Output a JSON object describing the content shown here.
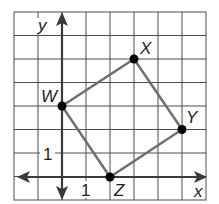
{
  "diagram": {
    "type": "coordinate-plane",
    "grid": {
      "columns": 8,
      "rows": 8,
      "x_range": [
        -2,
        6
      ],
      "y_range": [
        -1,
        7
      ],
      "line_color": "#4d4d4d"
    },
    "axes": {
      "x_label": "x",
      "y_label": "y",
      "x_tick_label": "1",
      "y_tick_label": "1",
      "color": "#3a3a3a"
    },
    "quadrilateral": {
      "stroke_color": "#6d6e71",
      "vertices": [
        {
          "label": "W",
          "x": 0,
          "y": 3
        },
        {
          "label": "X",
          "x": 3,
          "y": 5
        },
        {
          "label": "Y",
          "x": 5,
          "y": 2
        },
        {
          "label": "Z",
          "x": 2,
          "y": 0
        }
      ]
    }
  }
}
